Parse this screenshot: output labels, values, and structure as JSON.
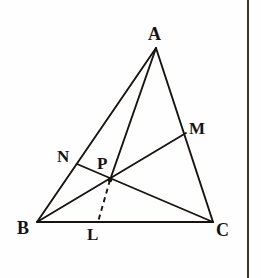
{
  "figure": {
    "type": "euclidean-geometry-diagram",
    "background_color": "#fefefe",
    "stroke_color": "#17130f",
    "canvas": {
      "width": 261,
      "height": 278
    },
    "page_edge": {
      "x": 247,
      "color": "#3a3530",
      "width": 2
    },
    "points": {
      "A": {
        "label": "A",
        "x": 156,
        "y": 48
      },
      "B": {
        "label": "B",
        "x": 37,
        "y": 222
      },
      "C": {
        "label": "C",
        "x": 213,
        "y": 222
      },
      "M": {
        "label": "M",
        "x": 186,
        "y": 133
      },
      "N": {
        "label": "N",
        "x": 77,
        "y": 164
      },
      "P": {
        "label": "P",
        "x": 110,
        "y": 180
      },
      "L": {
        "label": "L",
        "x": 98,
        "y": 222
      }
    },
    "segments": [
      {
        "name": "side-AB",
        "from": "A",
        "to": "B",
        "style": "solid"
      },
      {
        "name": "side-AC",
        "from": "A",
        "to": "C",
        "style": "solid"
      },
      {
        "name": "side-BC",
        "from": "B",
        "to": "C",
        "style": "solid"
      },
      {
        "name": "cevian-BM",
        "from": "B",
        "to": "M",
        "style": "solid"
      },
      {
        "name": "cevian-NC",
        "from": "N",
        "to": "C",
        "style": "solid"
      },
      {
        "name": "cevian-AP",
        "from": "A",
        "to": "P",
        "style": "solid"
      },
      {
        "name": "segment-PL",
        "from": "P",
        "to": "L",
        "style": "dashed"
      }
    ],
    "labels": [
      {
        "key": "A",
        "text": "A"
      },
      {
        "key": "B",
        "text": "B"
      },
      {
        "key": "C",
        "text": "C"
      },
      {
        "key": "M",
        "text": "M"
      },
      {
        "key": "N",
        "text": "N"
      },
      {
        "key": "P",
        "text": "P"
      },
      {
        "key": "L",
        "text": "L"
      }
    ]
  }
}
